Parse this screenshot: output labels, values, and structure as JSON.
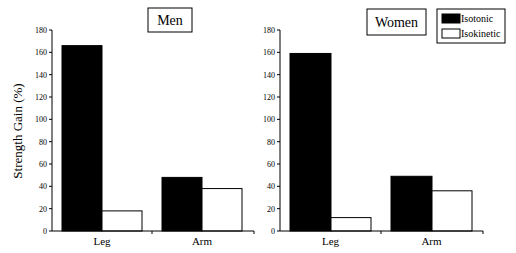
{
  "chart_data": [
    {
      "type": "bar",
      "title": "Men",
      "categories": [
        "Leg",
        "Arm"
      ],
      "series": [
        {
          "name": "Isotonic",
          "color": "#000000",
          "values": [
            166,
            48
          ]
        },
        {
          "name": "Isokinetic",
          "color": "#ffffff",
          "values": [
            18,
            38
          ]
        }
      ],
      "xlabel": "",
      "ylabel": "Strength Gain (%)",
      "ylim": [
        0,
        180
      ],
      "yticks": [
        0,
        20,
        40,
        60,
        80,
        100,
        120,
        140,
        160,
        180
      ],
      "grid": false
    },
    {
      "type": "bar",
      "title": "Women",
      "categories": [
        "Leg",
        "Arm"
      ],
      "series": [
        {
          "name": "Isotonic",
          "color": "#000000",
          "values": [
            159,
            49
          ]
        },
        {
          "name": "Isokinetic",
          "color": "#ffffff",
          "values": [
            12,
            36
          ]
        }
      ],
      "xlabel": "",
      "ylabel": "",
      "ylim": [
        0,
        180
      ],
      "yticks": [
        0,
        20,
        40,
        60,
        80,
        100,
        120,
        140,
        160,
        180
      ],
      "grid": false,
      "legend_position": "top-right"
    }
  ],
  "legend": {
    "items": [
      {
        "label": "Isotonic",
        "color": "#000000"
      },
      {
        "label": "Isokinetic",
        "color": "#ffffff"
      }
    ]
  },
  "ylabel": "Strength Gain (%)"
}
